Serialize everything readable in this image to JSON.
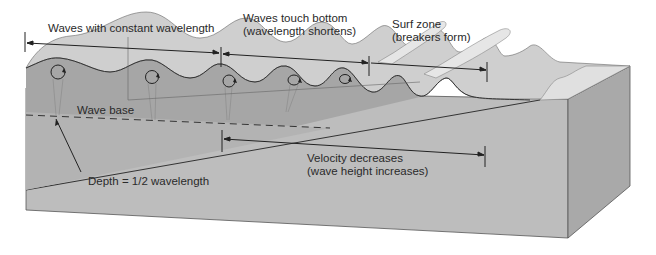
{
  "diagram": {
    "labels": {
      "constant_wavelength": "Waves with constant wavelength",
      "touch_bottom_line1": "Waves touch bottom",
      "touch_bottom_line2": "(wavelength shortens)",
      "surf_zone_line1": "Surf zone",
      "surf_zone_line2": "(breakers form)",
      "wave_base": "Wave base",
      "depth": "Depth = 1/2 wavelength",
      "velocity_line1": "Velocity decreases",
      "velocity_line2": "(wave height increases)"
    },
    "colors": {
      "background": "#ffffff",
      "block_front": "#bdbdbd",
      "block_side": "#a9a9a9",
      "water_section": "#a6a6a6",
      "wave_surface": "#cfcfcf",
      "foam": "#e6e6e6",
      "beach": "#d9d9d9",
      "line": "#333333"
    }
  }
}
